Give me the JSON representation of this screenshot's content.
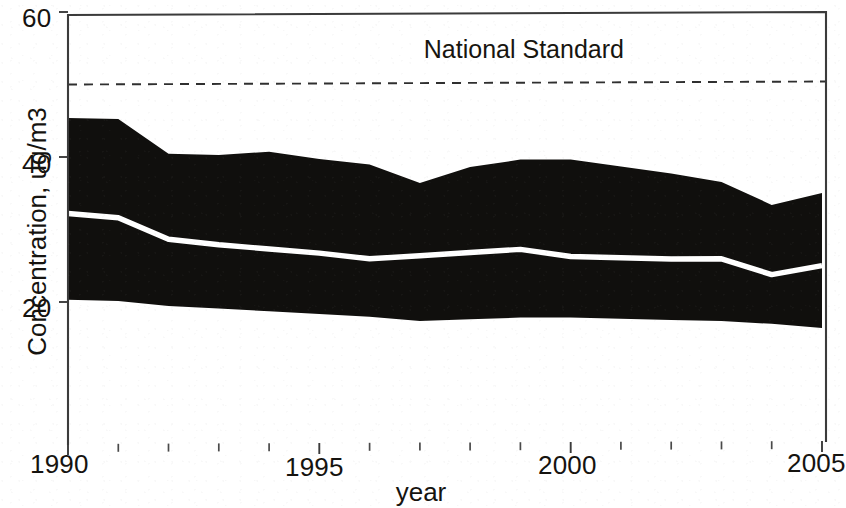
{
  "chart_data": {
    "type": "area",
    "title": "",
    "subtitle": "",
    "xlabel": "year",
    "ylabel": "Concentration, ug/m3",
    "xlim": [
      1990,
      2005
    ],
    "ylim": [
      0,
      60
    ],
    "yticks": [
      20,
      40,
      60
    ],
    "ytick_labels": [
      "20",
      "40",
      "60"
    ],
    "xticks": [
      1990,
      1995,
      2000,
      2005
    ],
    "xtick_labels": [
      "1990",
      "1995",
      "2000",
      "2005"
    ],
    "xminor_ticks": [
      1991,
      1992,
      1993,
      1994,
      1996,
      1997,
      1998,
      1999,
      2001,
      2002,
      2003,
      2004
    ],
    "grid": false,
    "legend": "none",
    "x": [
      1990,
      1991,
      1992,
      1993,
      1994,
      1995,
      1996,
      1997,
      1998,
      1999,
      2000,
      2001,
      2002,
      2003,
      2004,
      2005
    ],
    "series": [
      {
        "name": "Upper bound (max)",
        "role": "band-upper",
        "values": [
          45.4,
          45.2,
          40.4,
          40.2,
          40.6,
          39.6,
          38.8,
          36.2,
          38.4,
          39.4,
          39.4,
          38.4,
          37.4,
          36.2,
          33.0,
          34.6
        ]
      },
      {
        "name": "Mean concentration",
        "role": "line",
        "color": "#ffffff",
        "values": [
          32.2,
          31.6,
          28.6,
          27.8,
          27.2,
          26.6,
          25.8,
          26.2,
          26.6,
          27.0,
          26.0,
          25.8,
          25.6,
          25.6,
          23.4,
          24.6
        ]
      },
      {
        "name": "Lower bound (min)",
        "role": "band-lower",
        "values": [
          20.3,
          20.1,
          19.4,
          19.0,
          18.6,
          18.2,
          17.8,
          17.2,
          17.4,
          17.6,
          17.6,
          17.4,
          17.2,
          17.0,
          16.6,
          16.0
        ]
      }
    ],
    "reference_lines": [
      {
        "name": "National Standard",
        "label": "National Standard",
        "orientation": "horizontal",
        "value": 50,
        "style": "dashed",
        "color": "#2f2f2f"
      }
    ],
    "band_color": "#100f0d",
    "annotations": [
      {
        "text": "National Standard",
        "x": 2000.5,
        "y": 54
      }
    ]
  },
  "figure": {
    "background": "#ffffff",
    "axis_color": "#3b3b3b"
  }
}
